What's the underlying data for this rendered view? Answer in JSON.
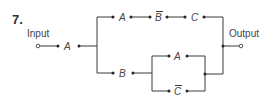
{
  "problem": {
    "number": "7."
  },
  "terminals": {
    "input_label": "Input",
    "output_label": "Output"
  },
  "switches": {
    "main": "A",
    "top_1": "A",
    "top_2": "B",
    "top_2_complement": true,
    "top_3": "C",
    "bottom_1": "B",
    "bottom_parallel_upper": "A",
    "bottom_parallel_lower": "C",
    "bottom_parallel_lower_complement": true
  },
  "colors": {
    "wire": "#3a3a3a",
    "text": "#444444",
    "background": "#ffffff"
  }
}
